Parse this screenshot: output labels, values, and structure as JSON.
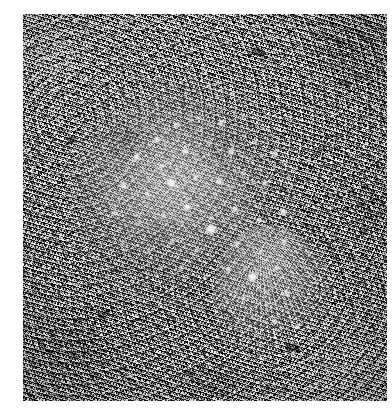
{
  "page": {
    "width": 392,
    "height": 408,
    "background_color": "#ffffff",
    "kind": "scanned-photograph"
  },
  "photo": {
    "title": "Flatfish camouflaged on gravel seabed",
    "subject": "flatfish",
    "color_mode": "grayscale",
    "orientation": "portrait",
    "plate": {
      "left": 23,
      "top": 14,
      "width": 364,
      "height": 387
    },
    "tones": {
      "paper_white": "#ffffff",
      "substrate_midtone": "#7d7d7d",
      "substrate_light": "#c8c8c8",
      "substrate_dark": "#2a2a2a",
      "fish_body_light": "#cdcdcd",
      "fish_body_mid": "#9a9a9a",
      "ocellus_white": "#ffffff"
    },
    "scene": {
      "background_description": "dense high-contrast shell-gravel and coarse sand",
      "subject_description": "flatfish lying flat, body mottled and speckled with pale ocelli, dorsal and anal fin fringe with radiating rays, caudal fin extending toward lower right"
    },
    "parts": [
      {
        "name": "body",
        "label": "fish body"
      },
      {
        "name": "fin-fringe",
        "label": "dorsal and anal fin fringe"
      },
      {
        "name": "tail",
        "label": "caudal fin"
      },
      {
        "name": "ocelli",
        "label": "pale spots"
      }
    ],
    "ocelli": [
      {
        "x": 96,
        "y": 58,
        "r": 4.2,
        "o": 0.8
      },
      {
        "x": 116,
        "y": 44,
        "r": 3.6,
        "o": 0.72
      },
      {
        "x": 138,
        "y": 36,
        "r": 3.2,
        "o": 0.66
      },
      {
        "x": 160,
        "y": 42,
        "r": 3.8,
        "o": 0.74
      },
      {
        "x": 182,
        "y": 34,
        "r": 3.0,
        "o": 0.62
      },
      {
        "x": 76,
        "y": 76,
        "r": 4.6,
        "o": 0.86
      },
      {
        "x": 100,
        "y": 84,
        "r": 3.4,
        "o": 0.7
      },
      {
        "x": 124,
        "y": 70,
        "r": 4.0,
        "o": 0.78
      },
      {
        "x": 148,
        "y": 62,
        "r": 3.2,
        "o": 0.64
      },
      {
        "x": 170,
        "y": 70,
        "r": 4.4,
        "o": 0.82
      },
      {
        "x": 194,
        "y": 60,
        "r": 3.2,
        "o": 0.64
      },
      {
        "x": 214,
        "y": 72,
        "r": 3.6,
        "o": 0.7
      },
      {
        "x": 62,
        "y": 104,
        "r": 4.0,
        "o": 0.78
      },
      {
        "x": 86,
        "y": 112,
        "r": 3.2,
        "o": 0.66
      },
      {
        "x": 110,
        "y": 102,
        "r": 5.2,
        "o": 0.92
      },
      {
        "x": 134,
        "y": 96,
        "r": 3.4,
        "o": 0.68
      },
      {
        "x": 158,
        "y": 100,
        "r": 4.2,
        "o": 0.8
      },
      {
        "x": 182,
        "y": 92,
        "r": 3.0,
        "o": 0.62
      },
      {
        "x": 204,
        "y": 102,
        "r": 3.8,
        "o": 0.74
      },
      {
        "x": 228,
        "y": 96,
        "r": 3.2,
        "o": 0.64
      },
      {
        "x": 54,
        "y": 132,
        "r": 3.6,
        "o": 0.72
      },
      {
        "x": 78,
        "y": 142,
        "r": 3.0,
        "o": 0.62
      },
      {
        "x": 102,
        "y": 134,
        "r": 3.4,
        "o": 0.68
      },
      {
        "x": 126,
        "y": 126,
        "r": 4.8,
        "o": 0.88
      },
      {
        "x": 150,
        "y": 136,
        "r": 3.2,
        "o": 0.64
      },
      {
        "x": 174,
        "y": 128,
        "r": 3.8,
        "o": 0.74
      },
      {
        "x": 198,
        "y": 138,
        "r": 3.2,
        "o": 0.66
      },
      {
        "x": 222,
        "y": 130,
        "r": 4.4,
        "o": 0.82
      },
      {
        "x": 62,
        "y": 162,
        "r": 3.2,
        "o": 0.64
      },
      {
        "x": 88,
        "y": 170,
        "r": 3.0,
        "o": 0.6
      },
      {
        "x": 112,
        "y": 160,
        "r": 3.6,
        "o": 0.7
      },
      {
        "x": 136,
        "y": 168,
        "r": 3.2,
        "o": 0.64
      },
      {
        "x": 150,
        "y": 148,
        "r": 6.2,
        "o": 0.98
      },
      {
        "x": 176,
        "y": 162,
        "r": 3.4,
        "o": 0.68
      },
      {
        "x": 200,
        "y": 170,
        "r": 3.0,
        "o": 0.62
      },
      {
        "x": 224,
        "y": 160,
        "r": 3.6,
        "o": 0.72
      },
      {
        "x": 96,
        "y": 194,
        "r": 3.0,
        "o": 0.6
      },
      {
        "x": 120,
        "y": 186,
        "r": 3.4,
        "o": 0.66
      },
      {
        "x": 144,
        "y": 196,
        "r": 3.0,
        "o": 0.6
      },
      {
        "x": 168,
        "y": 188,
        "r": 3.6,
        "o": 0.7
      },
      {
        "x": 192,
        "y": 196,
        "r": 5.6,
        "o": 0.94
      },
      {
        "x": 216,
        "y": 186,
        "r": 3.2,
        "o": 0.64
      },
      {
        "x": 182,
        "y": 216,
        "r": 3.4,
        "o": 0.68
      },
      {
        "x": 206,
        "y": 222,
        "r": 3.0,
        "o": 0.62
      },
      {
        "x": 226,
        "y": 212,
        "r": 3.8,
        "o": 0.74
      },
      {
        "x": 214,
        "y": 240,
        "r": 3.2,
        "o": 0.64
      },
      {
        "x": 236,
        "y": 246,
        "r": 3.6,
        "o": 0.7
      },
      {
        "x": 232,
        "y": 272,
        "r": 3.0,
        "o": 0.6
      }
    ],
    "pebbles": [
      {
        "x": 228,
        "y": 34,
        "w": 15,
        "h": 8,
        "rot": 18,
        "o": 0.55
      },
      {
        "x": 44,
        "y": 122,
        "w": 9,
        "h": 7,
        "rot": -22,
        "o": 0.5
      },
      {
        "x": 318,
        "y": 66,
        "w": 11,
        "h": 6,
        "rot": 36,
        "o": 0.45
      },
      {
        "x": 74,
        "y": 296,
        "w": 13,
        "h": 7,
        "rot": -14,
        "o": 0.48
      },
      {
        "x": 262,
        "y": 330,
        "w": 16,
        "h": 9,
        "rot": 8,
        "o": 0.52
      },
      {
        "x": 160,
        "y": 356,
        "w": 12,
        "h": 6,
        "rot": 25,
        "o": 0.46
      },
      {
        "x": 336,
        "y": 214,
        "w": 10,
        "h": 6,
        "rot": -30,
        "o": 0.44
      },
      {
        "x": 96,
        "y": 352,
        "w": 9,
        "h": 5,
        "rot": 12,
        "o": 0.42
      },
      {
        "x": 294,
        "y": 132,
        "w": 8,
        "h": 6,
        "rot": -8,
        "o": 0.4
      }
    ]
  }
}
